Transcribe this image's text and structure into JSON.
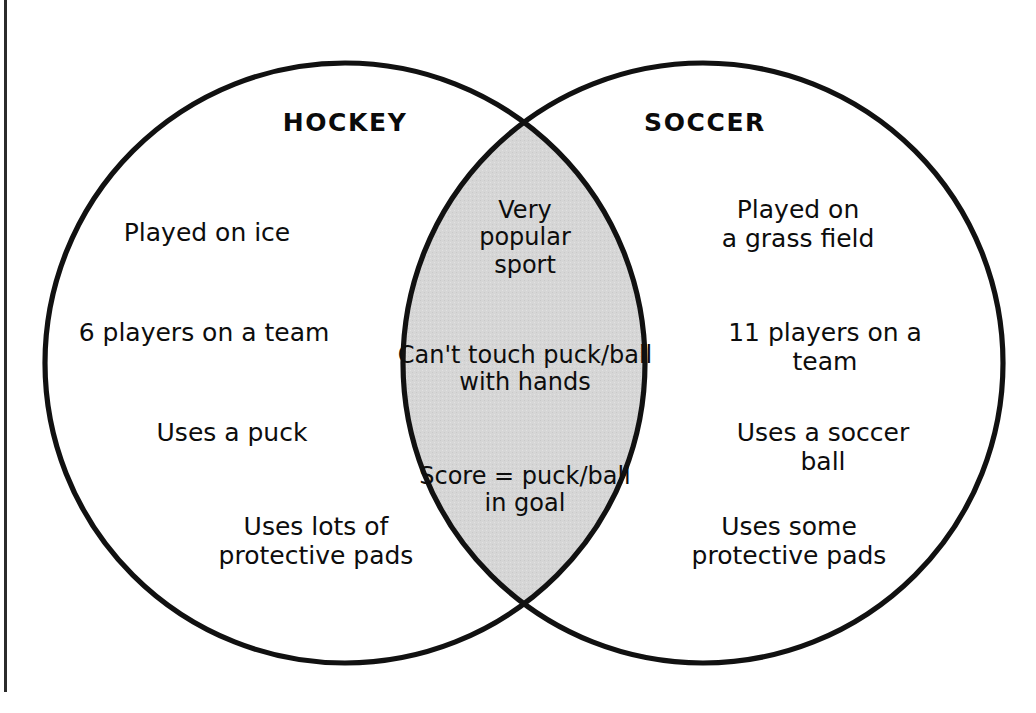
{
  "diagram": {
    "type": "venn",
    "kind": "two-set-venn-diagram",
    "background_color": "#ffffff",
    "stroke_color": "#111111",
    "intersection_fill_color": "#d6d6d6",
    "page_edge_rule_color": "#2b2b2b"
  },
  "left_set": {
    "title": "HOCKEY",
    "items": [
      {
        "id": "hockey-played-on-ice",
        "text": "Played on ice",
        "x": 207,
        "y": 218
      },
      {
        "id": "hockey-six-players",
        "text": "6 players on a team",
        "x": 204,
        "y": 318
      },
      {
        "id": "hockey-uses-a-puck",
        "text": "Uses a puck",
        "x": 232,
        "y": 418
      },
      {
        "id": "hockey-protective-pads",
        "text": "Uses lots of\nprotective pads",
        "x": 316,
        "y": 512
      }
    ]
  },
  "right_set": {
    "title": "SOCCER",
    "items": [
      {
        "id": "soccer-played-on-grass",
        "text": "Played on\na grass field",
        "x": 798,
        "y": 195
      },
      {
        "id": "soccer-eleven-players",
        "text": "11 players on a team",
        "x": 825,
        "y": 318
      },
      {
        "id": "soccer-uses-soccer-ball",
        "text": "Uses a soccer ball",
        "x": 823,
        "y": 418
      },
      {
        "id": "soccer-protective-pads",
        "text": "Uses some\nprotective pads",
        "x": 789,
        "y": 512
      }
    ]
  },
  "intersection": {
    "label": "shared by both sports",
    "items": [
      {
        "id": "shared-very-popular",
        "text": "Very\npopular\nsport",
        "x": 525,
        "y": 197
      },
      {
        "id": "shared-no-hands",
        "text": "Can't touch puck/ball\nwith hands",
        "x": 525,
        "y": 342
      },
      {
        "id": "shared-score-in-goal",
        "text": "Score = puck/ball\nin goal",
        "x": 525,
        "y": 463
      }
    ]
  },
  "geometry": {
    "left_circle": {
      "cx": 345,
      "cy": 363,
      "r": 300
    },
    "right_circle": {
      "cx": 703,
      "cy": 363,
      "r": 300
    },
    "crossing_top": {
      "x": 525,
      "y": 93
    },
    "crossing_bottom": {
      "x": 525,
      "y": 632
    },
    "stroke_width": 5
  }
}
